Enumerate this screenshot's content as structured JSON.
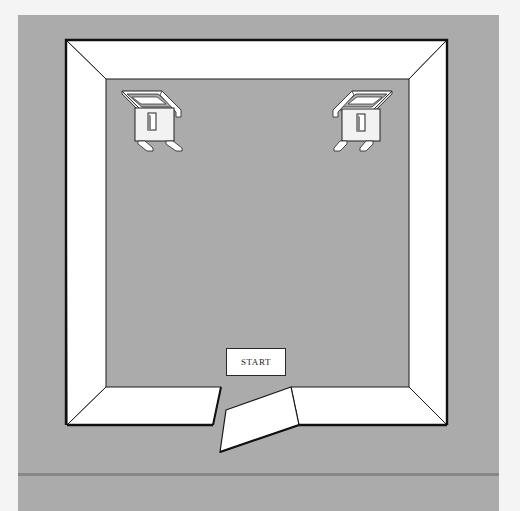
{
  "scene": {
    "type": "isometric-room",
    "colors": {
      "page_background": "#f4f4f4",
      "floor": "#ababab",
      "wall": "#ffffff",
      "outline": "#1a1a1a",
      "divider": "#878787"
    },
    "start_button": {
      "label": "START"
    },
    "objects": [
      {
        "name": "chair-left",
        "position": "top-left"
      },
      {
        "name": "chair-right",
        "position": "top-right"
      },
      {
        "name": "broken-wall-segment",
        "position": "bottom-center"
      }
    ]
  }
}
